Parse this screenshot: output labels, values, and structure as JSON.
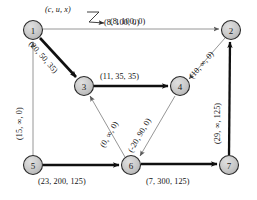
{
  "figure": {
    "legend": {
      "tuple_key": "(c, u, x)",
      "example_label": "(8, 100, 0)"
    },
    "colors": {
      "node_fill": "#c8c8c8",
      "node_stroke": "#2b2b2b",
      "thick_edge": "#101010",
      "thin_edge": "#808080",
      "text": "#111111",
      "background": "#ffffff"
    },
    "nodes": [
      {
        "id": "1",
        "label": "1",
        "cx": 33,
        "cy": 30,
        "r": 9.5
      },
      {
        "id": "2",
        "label": "2",
        "cx": 231,
        "cy": 30,
        "r": 9.5
      },
      {
        "id": "3",
        "label": "3",
        "cx": 84,
        "cy": 86,
        "r": 9.5
      },
      {
        "id": "4",
        "label": "4",
        "cx": 180,
        "cy": 86,
        "r": 9.5
      },
      {
        "id": "5",
        "label": "5",
        "cx": 33,
        "cy": 165,
        "r": 9.5
      },
      {
        "id": "6",
        "label": "6",
        "cx": 131,
        "cy": 165,
        "r": 9.5
      },
      {
        "id": "7",
        "label": "7",
        "cx": 229,
        "cy": 165,
        "r": 9.5
      }
    ],
    "edges": [
      {
        "id": "e-1-2",
        "from": "1",
        "to": "2",
        "label": "(8, 100, 0)",
        "weight": "thin",
        "cost": 8,
        "capacity": "100",
        "flow": 0
      },
      {
        "id": "e-1-3",
        "from": "1",
        "to": "3",
        "label": "(20, 50, 35)",
        "weight": "thick",
        "cost": 20,
        "capacity": "50",
        "flow": 35
      },
      {
        "id": "e-5-1",
        "from": "5",
        "to": "1",
        "label": "(15, ∞, 0)",
        "weight": "thin",
        "cost": 15,
        "capacity": "∞",
        "flow": 0
      },
      {
        "id": "e-3-4",
        "from": "3",
        "to": "4",
        "label": "(11, 35, 35)",
        "weight": "thick",
        "cost": 11,
        "capacity": "35",
        "flow": 35
      },
      {
        "id": "e-2-4",
        "from": "2",
        "to": "4",
        "label": "(10, ∞, 0)",
        "weight": "thin",
        "cost": 10,
        "capacity": "∞",
        "flow": 0
      },
      {
        "id": "e-7-2",
        "from": "7",
        "to": "2",
        "label": "(29, ∞, 125)",
        "weight": "thick",
        "cost": 29,
        "capacity": "∞",
        "flow": 125
      },
      {
        "id": "e-6-3",
        "from": "6",
        "to": "3",
        "label": "(0, ∞, 0)",
        "weight": "thin",
        "cost": 0,
        "capacity": "∞",
        "flow": 0
      },
      {
        "id": "e-4-6",
        "from": "4",
        "to": "6",
        "label": "(-20, 90, 0)",
        "weight": "thin",
        "cost": -20,
        "capacity": "90",
        "flow": 0
      },
      {
        "id": "e-5-6",
        "from": "5",
        "to": "6",
        "label": "(23, 200, 125)",
        "weight": "thick",
        "cost": 23,
        "capacity": "200",
        "flow": 125
      },
      {
        "id": "e-6-7",
        "from": "6",
        "to": "7",
        "label": "(7, 300, 125)",
        "weight": "thick",
        "cost": 7,
        "capacity": "300",
        "flow": 125
      }
    ]
  }
}
